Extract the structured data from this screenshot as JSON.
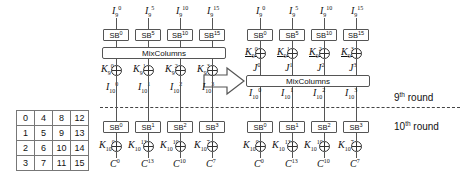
{
  "figure": {
    "type": "cipher-round-diagram"
  },
  "state_matrix": {
    "name": "aes-state-byte-index-matrix",
    "rows": [
      [
        "0",
        "4",
        "8",
        "12"
      ],
      [
        "1",
        "5",
        "9",
        "13"
      ],
      [
        "2",
        "6",
        "10",
        "14"
      ],
      [
        "3",
        "7",
        "11",
        "15"
      ]
    ]
  },
  "left_diagram": {
    "inputs": [
      {
        "base": "I",
        "sub": "9",
        "sup": "0"
      },
      {
        "base": "I",
        "sub": "9",
        "sup": "5"
      },
      {
        "base": "I",
        "sub": "9",
        "sup": "10"
      },
      {
        "base": "I",
        "sub": "9",
        "sup": "15"
      }
    ],
    "sbox_row_top": [
      "SB",
      "SB",
      "SB",
      "SB"
    ],
    "sbox_row_top_sup": [
      "0",
      "5",
      "10",
      "15"
    ],
    "mixcolumns_label": "MixColumns",
    "round_keys_9": [
      {
        "base": "K",
        "sub": "9",
        "sup": "0"
      },
      {
        "base": "K",
        "sub": "9",
        "sup": "1"
      },
      {
        "base": "K",
        "sub": "9",
        "sup": "2"
      },
      {
        "base": "K",
        "sub": "9",
        "sup": "3"
      }
    ],
    "intermediate_10": [
      {
        "base": "I",
        "sub": "10",
        "sup": "0"
      },
      {
        "base": "I",
        "sub": "10",
        "sup": "1"
      },
      {
        "base": "I",
        "sub": "10",
        "sup": "2"
      },
      {
        "base": "I",
        "sub": "10",
        "sup": "3"
      }
    ],
    "sbox_row_bottom": [
      "SB",
      "SB",
      "SB",
      "SB"
    ],
    "sbox_row_bottom_sup": [
      "0",
      "1",
      "2",
      "3"
    ],
    "round_keys_10": [
      {
        "base": "K",
        "sub": "10",
        "sup": "0"
      },
      {
        "base": "K",
        "sub": "10",
        "sup": "13"
      },
      {
        "base": "K",
        "sub": "10",
        "sup": "10"
      },
      {
        "base": "K",
        "sub": "10",
        "sup": "7"
      }
    ],
    "ciphertext": [
      {
        "base": "C",
        "sub": "",
        "sup": "0"
      },
      {
        "base": "C",
        "sub": "",
        "sup": "13"
      },
      {
        "base": "C",
        "sub": "",
        "sup": "10"
      },
      {
        "base": "C",
        "sub": "",
        "sup": "7"
      }
    ]
  },
  "right_diagram": {
    "inputs": [
      {
        "base": "I",
        "sub": "9",
        "sup": "0"
      },
      {
        "base": "I",
        "sub": "9",
        "sup": "5"
      },
      {
        "base": "I",
        "sub": "9",
        "sup": "10"
      },
      {
        "base": "I",
        "sub": "9",
        "sup": "15"
      }
    ],
    "sbox_row_top": [
      "SB",
      "SB",
      "SB",
      "SB"
    ],
    "sbox_row_top_sup": [
      "0",
      "5",
      "10",
      "15"
    ],
    "equivalent_keys_9": [
      {
        "base": "K",
        "sub": "9",
        "sup": "0"
      },
      {
        "base": "K",
        "sub": "9",
        "sup": "1"
      },
      {
        "base": "K",
        "sub": "9",
        "sup": "2"
      },
      {
        "base": "K",
        "sub": "9",
        "sup": "3"
      }
    ],
    "j_values": [
      {
        "base": "J",
        "sub": "",
        "sup": "0"
      },
      {
        "base": "J",
        "sub": "",
        "sup": "1"
      },
      {
        "base": "J",
        "sub": "",
        "sup": "2"
      },
      {
        "base": "J",
        "sub": "",
        "sup": "3"
      }
    ],
    "mixcolumns_label": "MixColumns",
    "intermediate_10": [
      {
        "base": "I",
        "sub": "10",
        "sup": "0"
      },
      {
        "base": "I",
        "sub": "10",
        "sup": "1"
      },
      {
        "base": "I",
        "sub": "10",
        "sup": "2"
      },
      {
        "base": "I",
        "sub": "10",
        "sup": "3"
      }
    ],
    "sbox_row_bottom": [
      "SB",
      "SB",
      "SB",
      "SB"
    ],
    "sbox_row_bottom_sup": [
      "0",
      "1",
      "2",
      "3"
    ],
    "round_keys_10": [
      {
        "base": "K",
        "sub": "10",
        "sup": "0"
      },
      {
        "base": "K",
        "sub": "10",
        "sup": "13"
      },
      {
        "base": "K",
        "sub": "10",
        "sup": "10"
      },
      {
        "base": "K",
        "sub": "10",
        "sup": "7"
      }
    ],
    "ciphertext": [
      {
        "base": "C",
        "sub": "",
        "sup": "0"
      },
      {
        "base": "C",
        "sub": "",
        "sup": "13"
      },
      {
        "base": "C",
        "sub": "",
        "sup": "10"
      },
      {
        "base": "C",
        "sub": "",
        "sup": "7"
      }
    ]
  },
  "annotations": {
    "round_9_label": "9",
    "round_9_sup": "th",
    "round_9_word": " round",
    "round_10_label": "10",
    "round_10_sup": "th",
    "round_10_word": " round"
  },
  "colors": {
    "line": "#555555",
    "text": "#111111",
    "dashed": "#444444",
    "background": "#ffffff"
  }
}
